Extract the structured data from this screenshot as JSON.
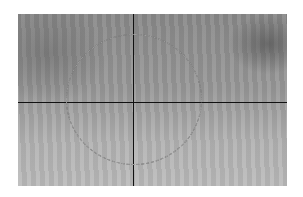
{
  "image": {
    "description": "grayscale textured image with crosshair and dashed circular overlay",
    "crosshair": {
      "x": 115,
      "y": 88
    },
    "circle": {
      "cx": 116,
      "cy": 85,
      "rx": 68,
      "ry": 65,
      "style": "dashed"
    },
    "colors": {
      "line": "#111111",
      "background": "#ffffff"
    }
  }
}
